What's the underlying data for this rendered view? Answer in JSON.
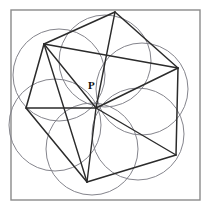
{
  "figure": {
    "background_color": "#ffffff",
    "frame": {
      "name": "square-border",
      "x": 11,
      "y": 10,
      "width": 189,
      "height": 190,
      "stroke_color": "#8a8a8a",
      "stroke_width": 1.4
    },
    "labels": [
      {
        "text": "P",
        "x": 88,
        "y": 80,
        "style": "bold-serif",
        "color": "#111111",
        "font_size": 11
      }
    ],
    "center_point": {
      "name": "convergence-point",
      "x": 96,
      "y": 108
    },
    "hexagon": {
      "name": "outer-hexagon",
      "stroke_color": "#2b2b2b",
      "stroke_width": 1.5,
      "vertices": [
        {
          "id": "V1",
          "x": 115,
          "y": 12
        },
        {
          "id": "V2",
          "x": 178,
          "y": 68
        },
        {
          "id": "V3",
          "x": 176,
          "y": 155
        },
        {
          "id": "V4",
          "x": 87,
          "y": 182
        },
        {
          "id": "V5",
          "x": 26,
          "y": 108
        },
        {
          "id": "V6",
          "x": 44,
          "y": 44
        }
      ],
      "edges": [
        [
          "V1",
          "V2"
        ],
        [
          "V2",
          "V3"
        ],
        [
          "V3",
          "V4"
        ],
        [
          "V4",
          "V5"
        ],
        [
          "V5",
          "V6"
        ],
        [
          "V6",
          "V1"
        ]
      ]
    },
    "diagonals": {
      "name": "radiating-diagonals",
      "stroke_color": "#2b2b2b",
      "stroke_width": 1.4,
      "from": {
        "x": 96,
        "y": 108
      },
      "to_vertices": [
        "V1",
        "V2",
        "V3",
        "V4",
        "V5",
        "V6"
      ],
      "extra_chords": [
        {
          "from": "V6",
          "to": "V2"
        },
        {
          "from": "V6",
          "to": "V4"
        }
      ]
    },
    "circles": {
      "name": "construction-circles",
      "count": 6,
      "radius": 46,
      "stroke_color": "#7d7d86",
      "stroke_width": 0.95,
      "centers": [
        {
          "id": "C1",
          "x": 105,
          "y": 61
        },
        {
          "id": "C2",
          "x": 142,
          "y": 89
        },
        {
          "id": "C3",
          "x": 138,
          "y": 134
        },
        {
          "id": "C4",
          "x": 92,
          "y": 149
        },
        {
          "id": "C5",
          "x": 55,
          "y": 125
        },
        {
          "id": "C6",
          "x": 59,
          "y": 75
        }
      ]
    }
  }
}
